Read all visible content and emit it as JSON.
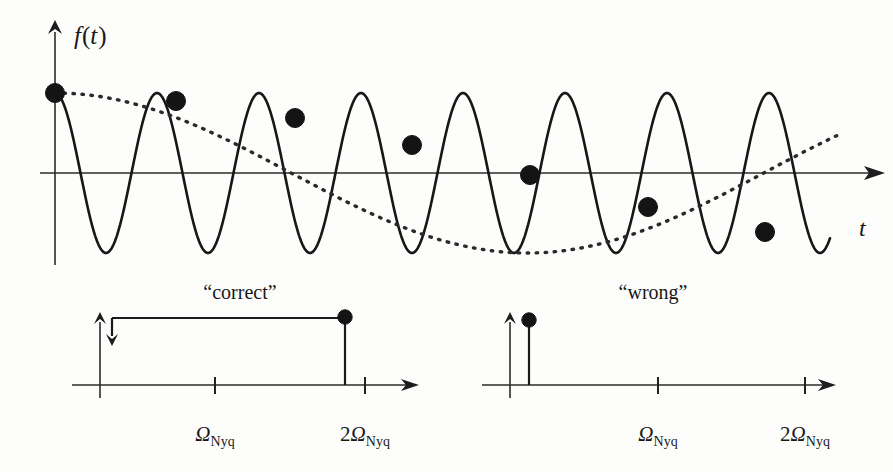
{
  "figure": {
    "title_top_left": "“correct”",
    "title_top_right": "“wrong”",
    "signal_axis_label": "f(t)",
    "signal_axis_label_f": "f",
    "signal_axis_label_paren_open": "(",
    "signal_axis_label_t": "t",
    "signal_axis_label_paren_close": ")",
    "time_axis_label": "t",
    "omega_symbol": "Ω",
    "omega_subscript": "Nyq",
    "two_prefix": "2",
    "colors": {
      "ink": "#181818",
      "axis": "#2b2b2b",
      "wave": "#171717",
      "alias": "#2a2a2a",
      "background": "#fdfdfc"
    }
  },
  "chart_data": [
    {
      "id": "time-domain-aliasing",
      "type": "line",
      "title": "",
      "xlabel": "t",
      "ylabel": "f(t)",
      "grid": false,
      "legend": null,
      "description": "A high-frequency sinusoid sampled too slowly; the sample points trace out a much slower apparent (aliased) sinusoid shown dotted.",
      "axes_px": {
        "x_axis_y": 173,
        "x_axis_x0": 40,
        "x_axis_x1": 883,
        "y_axis_x": 55,
        "y_axis_y0": 22,
        "y_axis_y1": 265
      },
      "series": [
        {
          "name": "true signal",
          "style": "solid",
          "kind": "cosine",
          "amplitude_px": 80,
          "period_px": 102.0,
          "phase_px": 0,
          "x_start_px": 55,
          "x_end_px": 830,
          "baseline_y_px": 173
        },
        {
          "name": "aliased reconstruction",
          "style": "dotted",
          "kind": "cosine",
          "amplitude_px": 80,
          "period_px": 945.0,
          "phase_px": 0,
          "x_start_px": 55,
          "x_end_px": 840,
          "baseline_y_px": 173
        }
      ],
      "sample_points_px": [
        {
          "x": 55,
          "y": 93
        },
        {
          "x": 176,
          "y": 101
        },
        {
          "x": 295,
          "y": 118
        },
        {
          "x": 412,
          "y": 145
        },
        {
          "x": 530,
          "y": 175
        },
        {
          "x": 648,
          "y": 207
        },
        {
          "x": 765,
          "y": 232
        }
      ],
      "sample_count": 7
    },
    {
      "id": "spectrum-correct",
      "type": "stem",
      "title": "“correct”",
      "xlabel": "Ω",
      "ylabel": "",
      "grid": false,
      "description": "Spectrum placed at the true (high) frequency, just below 2Ω_Nyq, outside the Nyquist band.",
      "axes_px": {
        "x_axis_y": 385,
        "x_axis_x0": 72,
        "x_axis_x1": 418,
        "y_axis_x": 100,
        "y_axis_y0": 315,
        "y_axis_y1": 398
      },
      "ticks": [
        {
          "label_main": "Ω",
          "label_sub": "Nyq",
          "prefix": "",
          "x_px": 215
        },
        {
          "label_main": "Ω",
          "label_sub": "Nyq",
          "prefix": "2",
          "x_px": 365
        }
      ],
      "impulses": [
        {
          "x_px": 345,
          "top_y_px": 318,
          "value_label": ""
        }
      ],
      "bracket": {
        "x0_px": 112,
        "x1_px": 345,
        "y_px": 318,
        "arrow_at": "left",
        "arrow_len_px": 24
      }
    },
    {
      "id": "spectrum-wrong",
      "type": "stem",
      "title": "“wrong”",
      "xlabel": "Ω",
      "ylabel": "",
      "grid": false,
      "description": "Spectrum folded back to a low apparent frequency near zero — the aliased, incorrect interpretation.",
      "axes_px": {
        "x_axis_y": 385,
        "x_axis_x0": 482,
        "x_axis_x1": 835,
        "y_axis_x": 510,
        "y_axis_y0": 315,
        "y_axis_y1": 398
      },
      "ticks": [
        {
          "label_main": "Ω",
          "label_sub": "Nyq",
          "prefix": "",
          "x_px": 658
        },
        {
          "label_main": "Ω",
          "label_sub": "Nyq",
          "prefix": "2",
          "x_px": 805
        }
      ],
      "impulses": [
        {
          "x_px": 529,
          "top_y_px": 320,
          "value_label": ""
        }
      ],
      "bracket": null
    }
  ]
}
